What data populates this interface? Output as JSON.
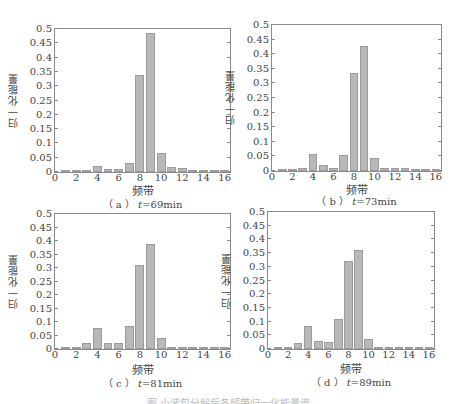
{
  "chart_data": [
    {
      "type": "bar",
      "panel": "a",
      "caption": "（ a ） t=69min",
      "caption_prefix": "（ a ） ",
      "caption_var": "t",
      "caption_value": "=69min",
      "title": "",
      "xlabel": "频带",
      "ylabel": "归一化能量",
      "xlim": [
        0,
        16.5
      ],
      "ylim": [
        0,
        0.5
      ],
      "xticks": [
        0,
        2,
        4,
        6,
        8,
        10,
        12,
        14,
        16
      ],
      "yticks": [
        0,
        0.05,
        0.1,
        0.15,
        0.2,
        0.25,
        0.3,
        0.35,
        0.4,
        0.45,
        0.5
      ],
      "categories": [
        1,
        2,
        3,
        4,
        5,
        6,
        7,
        8,
        9,
        10,
        11,
        12,
        13,
        14,
        15,
        16
      ],
      "values": [
        0.002,
        0.002,
        0.008,
        0.022,
        0.009,
        0.009,
        0.03,
        0.34,
        0.485,
        0.065,
        0.016,
        0.014,
        0.008,
        0.007,
        0.004,
        0.003
      ],
      "grid": false
    },
    {
      "type": "bar",
      "panel": "b",
      "caption": "（ b ） t=73min",
      "caption_prefix": "（ b ） ",
      "caption_var": "t",
      "caption_value": "=73min",
      "title": "",
      "xlabel": "频带",
      "ylabel": "归一化能量",
      "xlim": [
        0,
        16.5
      ],
      "ylim": [
        0,
        0.5
      ],
      "xticks": [
        0,
        2,
        4,
        6,
        8,
        10,
        12,
        14,
        16
      ],
      "yticks": [
        0,
        0.05,
        0.1,
        0.15,
        0.2,
        0.25,
        0.3,
        0.35,
        0.4,
        0.45,
        0.5
      ],
      "categories": [
        1,
        2,
        3,
        4,
        5,
        6,
        7,
        8,
        9,
        10,
        11,
        12,
        13,
        14,
        15,
        16
      ],
      "values": [
        0.001,
        0.003,
        0.012,
        0.057,
        0.021,
        0.012,
        0.055,
        0.335,
        0.427,
        0.043,
        0.009,
        0.01,
        0.009,
        0.007,
        0.006,
        0.004
      ],
      "grid": false
    },
    {
      "type": "bar",
      "panel": "c",
      "caption": "（ c ） t=81min",
      "caption_prefix": "（ c ） ",
      "caption_var": "t",
      "caption_value": "=81min",
      "title": "",
      "xlabel": "频带",
      "ylabel": "归一化能量",
      "xlim": [
        0,
        16.5
      ],
      "ylim": [
        0,
        0.5
      ],
      "xticks": [
        0,
        2,
        4,
        6,
        8,
        10,
        12,
        14,
        16
      ],
      "yticks": [
        0,
        0.05,
        0.1,
        0.15,
        0.2,
        0.25,
        0.3,
        0.35,
        0.4,
        0.45,
        0.5
      ],
      "categories": [
        1,
        2,
        3,
        4,
        5,
        6,
        7,
        8,
        9,
        10,
        11,
        12,
        13,
        14,
        15,
        16
      ],
      "values": [
        0.001,
        0.003,
        0.022,
        0.077,
        0.024,
        0.022,
        0.087,
        0.31,
        0.39,
        0.042,
        0.008,
        0.008,
        0.008,
        0.008,
        0.004,
        0.003
      ],
      "grid": false
    },
    {
      "type": "bar",
      "panel": "d",
      "caption": "（ d ） t=89min",
      "caption_prefix": "（ d ） ",
      "caption_var": "t",
      "caption_value": "=89min",
      "title": "",
      "xlabel": "频带",
      "ylabel": "归一化能量",
      "xlim": [
        0,
        16.5
      ],
      "ylim": [
        0,
        0.5
      ],
      "xticks": [
        0,
        2,
        4,
        6,
        8,
        10,
        12,
        14,
        16
      ],
      "yticks": [
        0,
        0.05,
        0.1,
        0.15,
        0.2,
        0.25,
        0.3,
        0.35,
        0.4,
        0.45,
        0.5
      ],
      "categories": [
        1,
        2,
        3,
        4,
        5,
        6,
        7,
        8,
        9,
        10,
        11,
        12,
        13,
        14,
        15,
        16
      ],
      "values": [
        0.001,
        0.002,
        0.021,
        0.083,
        0.028,
        0.025,
        0.11,
        0.32,
        0.36,
        0.035,
        0.006,
        0.005,
        0.005,
        0.004,
        0.002,
        0.002
      ],
      "grid": false
    }
  ],
  "layout": {
    "panels": [
      {
        "left": 54,
        "top": 28,
        "width": 177,
        "height": 145,
        "xlabel_y": 182,
        "caption_y": 196
      },
      {
        "left": 271,
        "top": 24,
        "width": 171,
        "height": 148,
        "xlabel_y": 181,
        "caption_y": 193
      },
      {
        "left": 54,
        "top": 213,
        "width": 177,
        "height": 137,
        "xlabel_y": 361,
        "caption_y": 375
      },
      {
        "left": 267,
        "top": 211,
        "width": 168,
        "height": 139,
        "xlabel_y": 360,
        "caption_y": 374
      }
    ],
    "bar_color": "#b8b8b8"
  },
  "figure_caption": "图  小波包分解后各频带归一化能量谱"
}
